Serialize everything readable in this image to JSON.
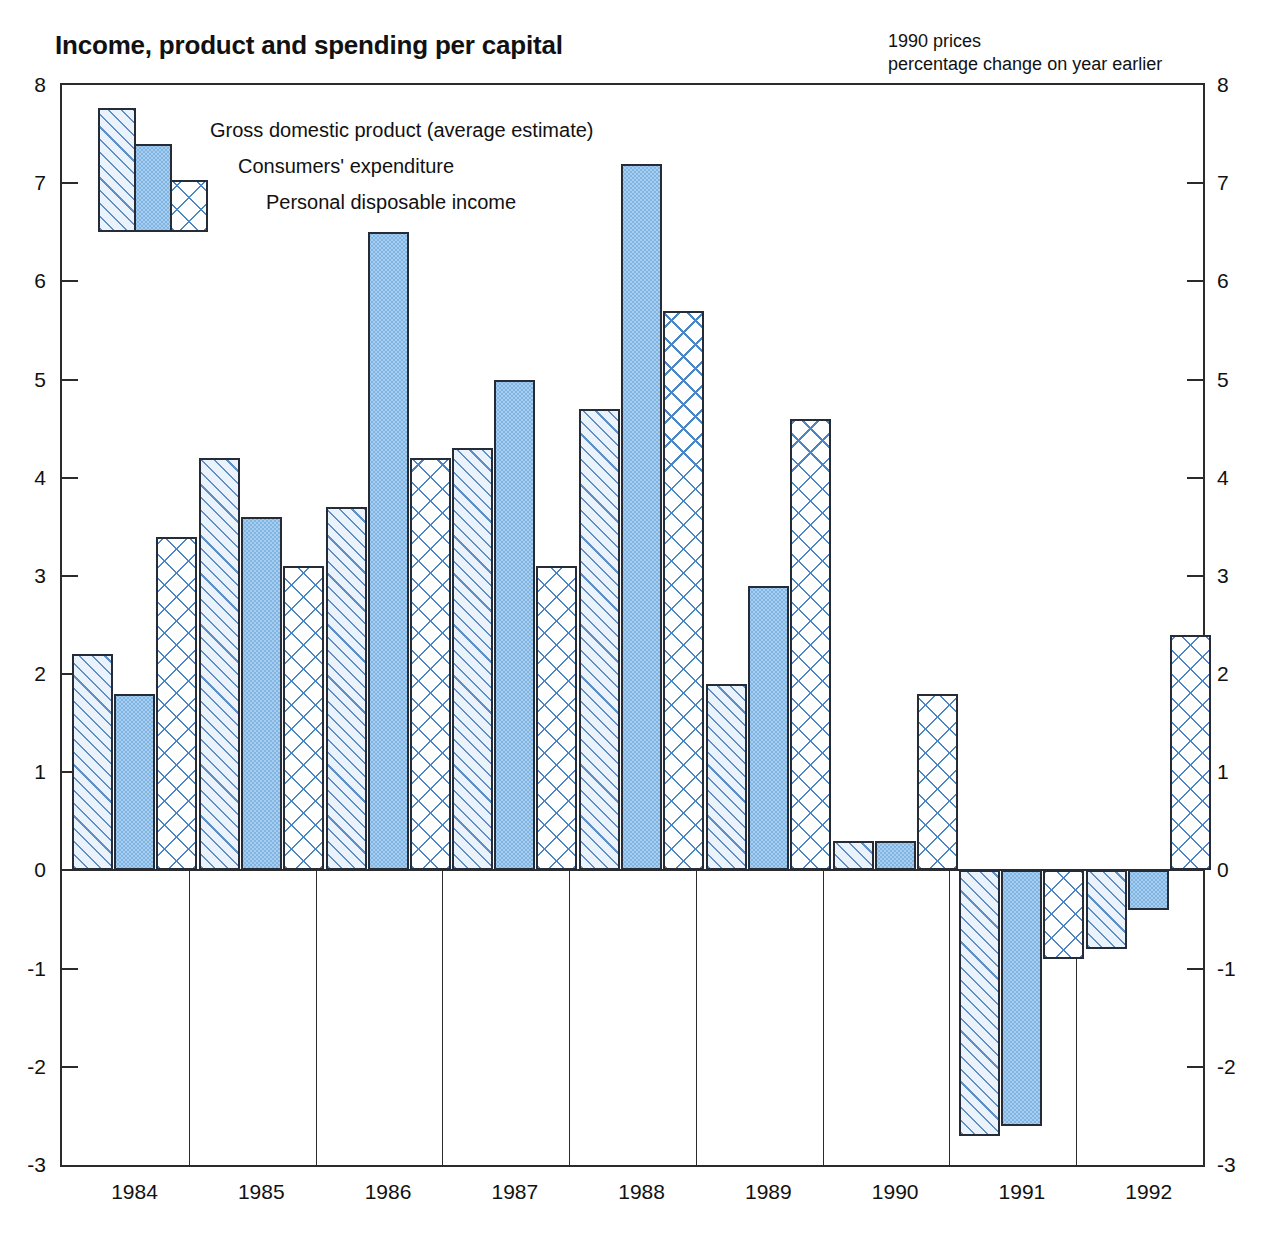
{
  "header": {
    "title": "Income, product and spending per capital",
    "subtitle_line1": "1990 prices",
    "subtitle_line2": "percentage change on year earlier"
  },
  "legend": {
    "items": [
      {
        "label": "Gross domestic product (average estimate)",
        "pattern": "diagonal-hatch",
        "color": "#eaf3fb"
      },
      {
        "label": "Consumers' expenditure",
        "pattern": "solid-stipple",
        "color": "#7fb5e3"
      },
      {
        "label": "Personal disposable income",
        "pattern": "cross-hatch",
        "color": "#ffffff"
      }
    ]
  },
  "axis": {
    "y_ticks": [
      "8",
      "7",
      "6",
      "5",
      "4",
      "3",
      "2",
      "1",
      "0",
      "-1",
      "-2",
      "-3"
    ],
    "y_values": [
      8,
      7,
      6,
      5,
      4,
      3,
      2,
      1,
      0,
      -1,
      -2,
      -3
    ]
  },
  "chart_data": {
    "type": "bar",
    "title": "Income, product and spending per capital",
    "subtitle": "1990 prices, percentage change on year earlier",
    "xlabel": "",
    "ylabel": "percentage change on year earlier",
    "ylim": [
      -3,
      8
    ],
    "grid": false,
    "legend_position": "top-left",
    "categories": [
      "1984",
      "1985",
      "1986",
      "1987",
      "1988",
      "1989",
      "1990",
      "1991",
      "1992"
    ],
    "series": [
      {
        "name": "Gross domestic product (average estimate)",
        "values": [
          2.2,
          4.2,
          3.7,
          4.3,
          4.7,
          1.9,
          0.3,
          -2.7,
          -0.8
        ]
      },
      {
        "name": "Consumers' expenditure",
        "values": [
          1.8,
          3.6,
          6.5,
          5.0,
          7.2,
          2.9,
          0.3,
          -2.6,
          -0.4
        ]
      },
      {
        "name": "Personal disposable income",
        "values": [
          3.4,
          3.1,
          4.2,
          3.1,
          5.7,
          4.6,
          1.8,
          -0.9,
          2.4
        ]
      }
    ]
  }
}
